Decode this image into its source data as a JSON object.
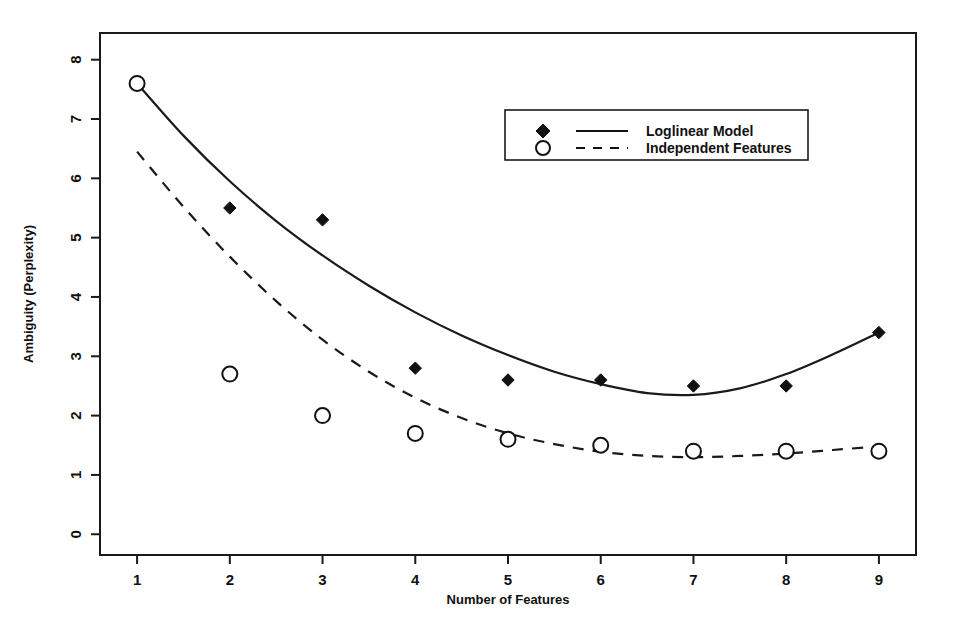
{
  "chart_data": {
    "type": "scatter",
    "title": "",
    "xlabel": "Number of Features",
    "ylabel": "Ambiguity (Perplexity)",
    "xlim": [
      0.6,
      9.4
    ],
    "ylim": [
      -0.35,
      8.45
    ],
    "x_ticks": [
      1,
      2,
      3,
      4,
      5,
      6,
      7,
      8,
      9
    ],
    "y_ticks": [
      0,
      1,
      2,
      3,
      4,
      5,
      6,
      7,
      8
    ],
    "x_tick_labels": [
      "1",
      "2",
      "3",
      "4",
      "5",
      "6",
      "7",
      "8",
      "9"
    ],
    "y_tick_labels": [
      "0",
      "1",
      "2",
      "3",
      "4",
      "5",
      "6",
      "7",
      "8"
    ],
    "grid": false,
    "legend_position": "upper right",
    "x": [
      1,
      2,
      3,
      4,
      5,
      6,
      7,
      8,
      9
    ],
    "series": [
      {
        "name": "Loglinear Model",
        "marker": "filled-diamond",
        "line_style": "solid",
        "color": "#111111",
        "values": [
          7.6,
          5.5,
          5.3,
          2.8,
          2.6,
          2.6,
          2.5,
          2.5,
          3.4
        ],
        "fit_curve": [
          [
            1.0,
            7.6
          ],
          [
            1.5,
            6.72
          ],
          [
            2.0,
            5.95
          ],
          [
            2.5,
            5.28
          ],
          [
            3.0,
            4.7
          ],
          [
            3.5,
            4.19
          ],
          [
            4.0,
            3.74
          ],
          [
            4.5,
            3.35
          ],
          [
            5.0,
            3.02
          ],
          [
            5.5,
            2.74
          ],
          [
            6.0,
            2.53
          ],
          [
            6.5,
            2.38
          ],
          [
            7.0,
            2.35
          ],
          [
            7.5,
            2.46
          ],
          [
            8.0,
            2.7
          ],
          [
            8.5,
            3.03
          ],
          [
            9.0,
            3.4
          ]
        ]
      },
      {
        "name": "Independent Features",
        "marker": "open-circle",
        "line_style": "dashed",
        "color": "#111111",
        "values": [
          7.6,
          2.7,
          2.0,
          1.7,
          1.6,
          1.5,
          1.4,
          1.4,
          1.4
        ],
        "fit_curve": [
          [
            1.0,
            6.45
          ],
          [
            1.5,
            5.52
          ],
          [
            2.0,
            4.68
          ],
          [
            2.5,
            3.93
          ],
          [
            3.0,
            3.28
          ],
          [
            3.5,
            2.74
          ],
          [
            4.0,
            2.3
          ],
          [
            4.5,
            1.96
          ],
          [
            5.0,
            1.7
          ],
          [
            5.5,
            1.52
          ],
          [
            6.0,
            1.39
          ],
          [
            6.5,
            1.32
          ],
          [
            7.0,
            1.3
          ],
          [
            7.5,
            1.32
          ],
          [
            8.0,
            1.36
          ],
          [
            8.5,
            1.42
          ],
          [
            9.0,
            1.48
          ]
        ]
      }
    ],
    "legend": [
      {
        "label": "Loglinear Model",
        "marker": "filled-diamond",
        "line_style": "solid"
      },
      {
        "label": "Independent Features",
        "marker": "open-circle",
        "line_style": "dashed"
      }
    ]
  }
}
